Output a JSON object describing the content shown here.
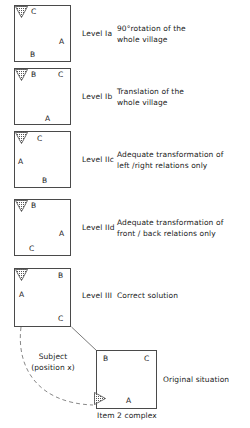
{
  "figure": {
    "caption": "Item 2 complex",
    "subject_label": "Subject\n(position x)",
    "original_label": "Original situation"
  },
  "colors": {
    "stroke": "#4a4a4a",
    "text": "#1a1a1a",
    "stipple": "#555555",
    "background": "#ffffff"
  },
  "rows": [
    {
      "id": "level-ia",
      "level": "Level Ia",
      "description": "90°rotation of the\nwhole village",
      "marker": "down-triangle",
      "letters": [
        {
          "text": "C",
          "pos": "top-left"
        },
        {
          "text": "A",
          "pos": "mid-right"
        },
        {
          "text": "B",
          "pos": "bottom-left"
        }
      ]
    },
    {
      "id": "level-ib",
      "level": "Level Ib",
      "description": "Translation of the\nwhole village",
      "marker": "down-triangle",
      "letters": [
        {
          "text": "B",
          "pos": "top-left"
        },
        {
          "text": "C",
          "pos": "top-right"
        },
        {
          "text": "A",
          "pos": "bottom-center"
        }
      ]
    },
    {
      "id": "level-iic",
      "level": "Level IIc",
      "description": "Adequate transformation of\nleft /right relations only",
      "marker": "down-triangle",
      "letters": [
        {
          "text": "C",
          "pos": "top-center"
        },
        {
          "text": "A",
          "pos": "mid-left"
        },
        {
          "text": "B",
          "pos": "bottom-center"
        }
      ]
    },
    {
      "id": "level-iid",
      "level": "Level IId",
      "description": "Adequate transformation of\nfront / back relations only",
      "marker": "down-triangle",
      "letters": [
        {
          "text": "B",
          "pos": "top-left"
        },
        {
          "text": "A",
          "pos": "mid-right"
        },
        {
          "text": "C",
          "pos": "bottom-left"
        }
      ]
    },
    {
      "id": "level-iii",
      "level": "Level III",
      "description": "Correct solution",
      "marker": "down-triangle",
      "letters": [
        {
          "text": "B",
          "pos": "top-right"
        },
        {
          "text": "A",
          "pos": "mid-left"
        },
        {
          "text": "C",
          "pos": "bottom-right"
        }
      ]
    }
  ],
  "original": {
    "id": "original-situation",
    "marker": "right-triangle",
    "letters": [
      {
        "text": "B",
        "pos": "top-left"
      },
      {
        "text": "C",
        "pos": "top-right"
      },
      {
        "text": "A",
        "pos": "bottom-center"
      }
    ]
  }
}
